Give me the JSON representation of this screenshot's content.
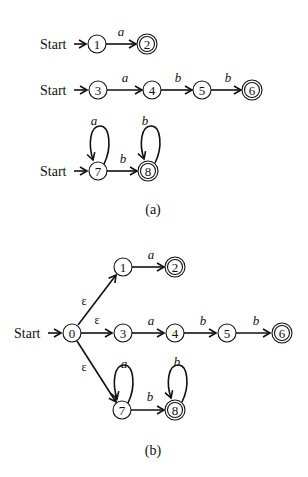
{
  "figure": {
    "panel_a": {
      "caption": "(a)",
      "start_label": "Start",
      "rows": [
        {
          "states": [
            {
              "id": "1",
              "label": "1",
              "accepting": false
            },
            {
              "id": "2",
              "label": "2",
              "accepting": true
            }
          ],
          "transitions": [
            {
              "from": "1",
              "to": "2",
              "symbol": "a"
            }
          ]
        },
        {
          "states": [
            {
              "id": "3",
              "label": "3",
              "accepting": false
            },
            {
              "id": "4",
              "label": "4",
              "accepting": false
            },
            {
              "id": "5",
              "label": "5",
              "accepting": false
            },
            {
              "id": "6",
              "label": "6",
              "accepting": true
            }
          ],
          "transitions": [
            {
              "from": "3",
              "to": "4",
              "symbol": "a"
            },
            {
              "from": "4",
              "to": "5",
              "symbol": "b"
            },
            {
              "from": "5",
              "to": "6",
              "symbol": "b"
            }
          ]
        },
        {
          "states": [
            {
              "id": "7",
              "label": "7",
              "accepting": false
            },
            {
              "id": "8",
              "label": "8",
              "accepting": true
            }
          ],
          "transitions": [
            {
              "from": "7",
              "to": "7",
              "symbol": "a"
            },
            {
              "from": "7",
              "to": "8",
              "symbol": "b"
            },
            {
              "from": "8",
              "to": "8",
              "symbol": "b"
            }
          ]
        }
      ]
    },
    "panel_b": {
      "caption": "(b)",
      "start_label": "Start",
      "states": [
        {
          "id": "0",
          "label": "0",
          "accepting": false
        },
        {
          "id": "1",
          "label": "1",
          "accepting": false
        },
        {
          "id": "2",
          "label": "2",
          "accepting": true
        },
        {
          "id": "3",
          "label": "3",
          "accepting": false
        },
        {
          "id": "4",
          "label": "4",
          "accepting": false
        },
        {
          "id": "5",
          "label": "5",
          "accepting": false
        },
        {
          "id": "6",
          "label": "6",
          "accepting": true
        },
        {
          "id": "7",
          "label": "7",
          "accepting": false
        },
        {
          "id": "8",
          "label": "8",
          "accepting": true
        }
      ],
      "transitions": [
        {
          "from": "0",
          "to": "1",
          "symbol": "ε"
        },
        {
          "from": "0",
          "to": "3",
          "symbol": "ε"
        },
        {
          "from": "0",
          "to": "7",
          "symbol": "ε"
        },
        {
          "from": "1",
          "to": "2",
          "symbol": "a"
        },
        {
          "from": "3",
          "to": "4",
          "symbol": "a"
        },
        {
          "from": "4",
          "to": "5",
          "symbol": "b"
        },
        {
          "from": "5",
          "to": "6",
          "symbol": "b"
        },
        {
          "from": "7",
          "to": "7",
          "symbol": "a"
        },
        {
          "from": "7",
          "to": "8",
          "symbol": "b"
        },
        {
          "from": "8",
          "to": "8",
          "symbol": "b"
        }
      ]
    }
  }
}
